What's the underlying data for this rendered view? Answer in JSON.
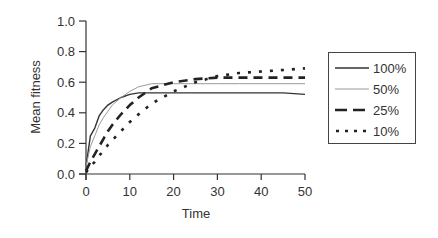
{
  "chart_data": {
    "type": "line",
    "title": "",
    "xlabel": "Time",
    "ylabel": "Mean fitness",
    "xlim": [
      0,
      50
    ],
    "ylim": [
      0.0,
      1.0
    ],
    "xticks": [
      0,
      10,
      20,
      30,
      40,
      50
    ],
    "yticks": [
      0.0,
      0.2,
      0.4,
      0.6,
      0.8,
      1.0
    ],
    "xtick_labels": [
      "0",
      "10",
      "20",
      "30",
      "40",
      "50"
    ],
    "ytick_labels": [
      "0.0",
      "0.2",
      "0.4",
      "0.6",
      "0.8",
      "1.0"
    ],
    "grid": false,
    "legend_position": "right",
    "x": [
      0,
      1,
      2,
      3,
      4,
      5,
      6,
      8,
      10,
      12,
      15,
      20,
      25,
      30,
      35,
      40,
      45,
      50
    ],
    "series": [
      {
        "name": "100%",
        "style": "solid",
        "color": "#333333",
        "width": 1.4,
        "values": [
          0.05,
          0.25,
          0.3,
          0.38,
          0.42,
          0.45,
          0.47,
          0.5,
          0.52,
          0.53,
          0.53,
          0.53,
          0.53,
          0.53,
          0.53,
          0.53,
          0.53,
          0.52
        ]
      },
      {
        "name": "50%",
        "style": "thin",
        "color": "#999999",
        "width": 1.0,
        "values": [
          0.05,
          0.18,
          0.25,
          0.32,
          0.37,
          0.41,
          0.45,
          0.5,
          0.54,
          0.57,
          0.59,
          0.59,
          0.59,
          0.59,
          0.59,
          0.59,
          0.59,
          0.59
        ]
      },
      {
        "name": "25%",
        "style": "dashed",
        "color": "#222222",
        "width": 2.6,
        "values": [
          0.02,
          0.08,
          0.13,
          0.18,
          0.23,
          0.28,
          0.32,
          0.39,
          0.45,
          0.5,
          0.56,
          0.6,
          0.62,
          0.63,
          0.63,
          0.63,
          0.63,
          0.63
        ]
      },
      {
        "name": "10%",
        "style": "dotted",
        "color": "#222222",
        "width": 2.6,
        "values": [
          0.01,
          0.05,
          0.08,
          0.12,
          0.15,
          0.19,
          0.22,
          0.28,
          0.34,
          0.39,
          0.46,
          0.54,
          0.6,
          0.64,
          0.66,
          0.67,
          0.68,
          0.69
        ]
      }
    ]
  },
  "legend": {
    "items": [
      {
        "label": "100%"
      },
      {
        "label": "50%"
      },
      {
        "label": "25%"
      },
      {
        "label": "10%"
      }
    ]
  }
}
